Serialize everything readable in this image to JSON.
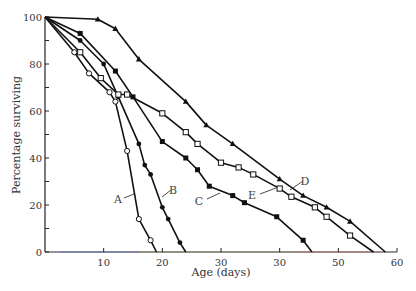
{
  "chart_data": {
    "type": "line",
    "title": "",
    "xlabel": "Age (days)",
    "ylabel": "Percentage surviving",
    "xlim": [
      0,
      60
    ],
    "ylim": [
      0,
      100
    ],
    "grid": false,
    "legend": "inline labels",
    "x_ticks": [
      10,
      20,
      30,
      40,
      50,
      60
    ],
    "x_tick_labels": [
      "10",
      "20",
      "30",
      "30",
      "50",
      "60"
    ],
    "y_ticks": [
      0,
      20,
      40,
      60,
      80,
      100
    ],
    "y_tick_labels": [
      "0",
      "20",
      "40",
      "60",
      "80",
      "100"
    ],
    "series": [
      {
        "name": "A",
        "marker": "open-circle",
        "points": [
          [
            0,
            100
          ],
          [
            5,
            85
          ],
          [
            7.5,
            76
          ],
          [
            11,
            68
          ],
          [
            12,
            64
          ],
          [
            14,
            43
          ],
          [
            16,
            14
          ],
          [
            18,
            5
          ],
          [
            19,
            0
          ]
        ],
        "label_pos": [
          13,
          23
        ]
      },
      {
        "name": "B",
        "marker": "filled-circle",
        "points": [
          [
            0,
            100
          ],
          [
            6,
            90
          ],
          [
            10,
            80
          ],
          [
            12.5,
            66
          ],
          [
            16,
            46
          ],
          [
            17,
            37
          ],
          [
            18,
            33
          ],
          [
            20,
            19
          ],
          [
            21,
            14
          ],
          [
            23,
            4
          ],
          [
            24,
            0
          ]
        ],
        "label_pos": [
          21.5,
          26
        ]
      },
      {
        "name": "C",
        "marker": "filled-square",
        "points": [
          [
            0,
            100
          ],
          [
            6,
            93
          ],
          [
            12,
            77
          ],
          [
            15,
            66
          ],
          [
            20,
            47
          ],
          [
            24,
            40
          ],
          [
            26,
            35
          ],
          [
            28,
            28
          ],
          [
            32,
            24
          ],
          [
            34,
            21
          ],
          [
            39.5,
            15
          ],
          [
            44,
            5
          ],
          [
            45.5,
            0
          ]
        ],
        "label_pos": [
          27,
          22
        ]
      },
      {
        "name": "D",
        "marker": "filled-triangle",
        "points": [
          [
            0,
            100
          ],
          [
            9,
            99
          ],
          [
            12,
            95
          ],
          [
            16,
            82
          ],
          [
            24,
            64
          ],
          [
            27.5,
            54
          ],
          [
            32,
            46
          ],
          [
            40,
            31
          ],
          [
            44,
            24
          ],
          [
            48,
            19
          ],
          [
            52,
            13
          ],
          [
            58,
            0
          ]
        ],
        "label_pos": [
          45,
          30
        ]
      },
      {
        "name": "E",
        "marker": "open-square",
        "points": [
          [
            0,
            100
          ],
          [
            6,
            85
          ],
          [
            9.5,
            74
          ],
          [
            12.5,
            67
          ],
          [
            14,
            67
          ],
          [
            20,
            59
          ],
          [
            24,
            51
          ],
          [
            26,
            46
          ],
          [
            30,
            38
          ],
          [
            33,
            36
          ],
          [
            35.5,
            33
          ],
          [
            40,
            27
          ],
          [
            42,
            23.5
          ],
          [
            46,
            19
          ],
          [
            48,
            15
          ],
          [
            52,
            7
          ],
          [
            56,
            0
          ]
        ],
        "label_pos": [
          35.5,
          25
        ]
      }
    ]
  }
}
